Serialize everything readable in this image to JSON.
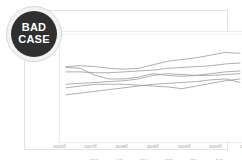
{
  "badge": {
    "line1": "BAD",
    "line2": "CASE",
    "bg_color": "#2f2f2f",
    "ring_color": "#f2f2f2",
    "text_color": "#ffffff"
  },
  "chart_data": {
    "type": "line",
    "title": "",
    "subtitle": "",
    "xlabel": "",
    "ylabel": "",
    "grid": false,
    "legend_position": "bottom",
    "line_color": "#9a9a9a",
    "x": [
      "2015",
      "2016",
      "2017",
      "2018",
      "2019",
      "2020",
      "2021",
      "2022",
      "2023",
      "2024",
      "2025",
      "2026",
      "2027"
    ],
    "tick_labels": [
      "2015년",
      "2017년",
      "2019년",
      "2021년",
      "2023년",
      "2025년",
      "2027년"
    ],
    "ylim": [
      0,
      100
    ],
    "series": [
      {
        "name": "전체",
        "values": [
          72,
          73,
          72,
          70,
          69,
          70,
          74,
          78,
          80,
          82,
          85,
          88,
          87
        ]
      },
      {
        "name": "서울",
        "values": [
          66,
          66,
          65,
          65,
          66,
          67,
          68,
          70,
          71,
          72,
          73,
          75,
          76
        ]
      },
      {
        "name": "경기",
        "values": [
          71,
          70,
          62,
          58,
          58,
          60,
          64,
          62,
          61,
          62,
          64,
          66,
          67
        ]
      },
      {
        "name": "인천",
        "values": [
          52,
          53,
          54,
          55,
          56,
          58,
          62,
          64,
          63,
          62,
          62,
          63,
          64
        ]
      },
      {
        "name": "경남",
        "values": [
          48,
          50,
          52,
          52,
          52,
          51,
          50,
          49,
          47,
          50,
          53,
          56,
          58
        ]
      },
      {
        "name": "충청",
        "values": [
          40,
          42,
          44,
          46,
          48,
          50,
          52,
          53,
          54,
          55,
          57,
          58,
          54
        ]
      }
    ]
  },
  "legend": {
    "items": [
      {
        "label": "전체"
      },
      {
        "label": "서울"
      },
      {
        "label": "경기"
      },
      {
        "label": "인천"
      },
      {
        "label": "경남"
      },
      {
        "label": "충청"
      }
    ]
  }
}
